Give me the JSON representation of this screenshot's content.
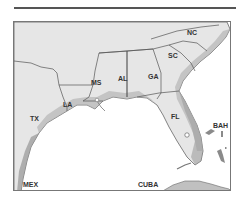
{
  "map": {
    "region": "Southeastern United States",
    "colors": {
      "land": "#e6e6e6",
      "coast_shade": "#9a9a9a",
      "water": "#ffffff",
      "border": "#555555",
      "label": "#333333"
    },
    "labels": {
      "nc": "NC",
      "sc": "SC",
      "ga": "GA",
      "al": "AL",
      "ms": "MS",
      "la": "LA",
      "tx": "TX",
      "fl": "FL",
      "bah": "BAH",
      "cuba": "CUBA",
      "mex": "MEX"
    },
    "markers": [
      {
        "name": "florida-city-marker",
        "type": "open-circle"
      }
    ]
  }
}
